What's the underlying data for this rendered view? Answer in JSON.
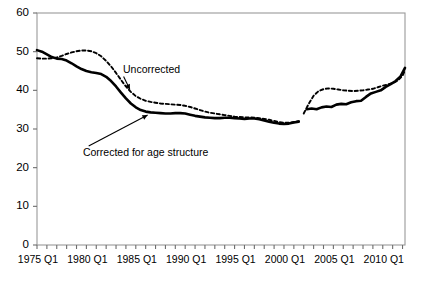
{
  "chart_data": {
    "type": "line",
    "title": "",
    "subtitle": "",
    "xlabel": "",
    "ylabel": "",
    "xlim": [
      1975.0,
      2012.25
    ],
    "ylim": [
      0,
      60
    ],
    "grid": false,
    "legend_position": "inline-annotations",
    "y_ticks": [
      0,
      10,
      20,
      30,
      40,
      50,
      60
    ],
    "y_tick_labels": [
      "0",
      "10",
      "20",
      "30",
      "40",
      "50",
      "60"
    ],
    "x_tick_labels": [
      "1975 Q1",
      "1980 Q1",
      "1985 Q1",
      "1990 Q1",
      "1995 Q1",
      "2000 Q1",
      "2005 Q1",
      "2010 Q1"
    ],
    "x_tick_label_values": [
      1975,
      1980,
      1985,
      1990,
      1995,
      2000,
      2005,
      2010
    ],
    "x_minor_tick_interval": 1,
    "annotations": [
      {
        "text": "Uncorrected",
        "x": 1986.6,
        "y": 44.6,
        "arrow_to_x": 1984.4,
        "arrow_to_y": 40.2
      },
      {
        "text": "Corrected for age structure",
        "x": 1986.0,
        "y": 23.0,
        "arrow_to_x": 1986.2,
        "arrow_to_y": 33.6
      }
    ],
    "series": [
      {
        "name": "Uncorrected",
        "style": "dashed",
        "color": "#000000",
        "segments": [
          {
            "x": [
              1975.0,
              1975.5,
              1976.0,
              1976.5,
              1977.0,
              1977.5,
              1978.0,
              1978.5,
              1979.0,
              1979.5,
              1980.0,
              1980.5,
              1981.0,
              1981.5,
              1982.0,
              1982.5,
              1983.0,
              1983.5,
              1984.0,
              1984.5,
              1985.0,
              1985.5,
              1986.0,
              1986.5,
              1987.0,
              1987.5,
              1988.0,
              1988.5,
              1989.0,
              1989.5,
              1990.0,
              1990.5,
              1991.0,
              1991.5,
              1992.0,
              1992.5,
              1993.0,
              1993.5,
              1994.0,
              1994.5,
              1995.0,
              1995.5,
              1996.0,
              1996.5,
              1997.0,
              1997.5,
              1998.0,
              1998.5,
              1999.0,
              1999.5,
              2000.0,
              2000.5,
              2001.0,
              2001.5
            ],
            "y": [
              48.3,
              48.2,
              48.2,
              48.3,
              48.5,
              48.9,
              49.4,
              49.8,
              50.1,
              50.3,
              50.3,
              50.1,
              49.6,
              48.8,
              47.6,
              46.2,
              44.5,
              42.7,
              41.0,
              39.6,
              38.5,
              37.8,
              37.3,
              37.0,
              36.8,
              36.6,
              36.5,
              36.4,
              36.3,
              36.2,
              36.0,
              35.7,
              35.3,
              34.9,
              34.5,
              34.2,
              34.0,
              33.8,
              33.6,
              33.4,
              33.2,
              33.1,
              33.0,
              33.0,
              32.9,
              32.8,
              32.6,
              32.4,
              32.1,
              31.8,
              31.6,
              31.6,
              31.8,
              32.0
            ]
          },
          {
            "x": [
              2002.0,
              2002.5,
              2003.0,
              2003.5,
              2004.0,
              2004.5,
              2005.0,
              2005.5,
              2006.0,
              2006.5,
              2007.0,
              2007.5,
              2008.0,
              2008.5,
              2009.0,
              2009.5,
              2010.0,
              2010.5,
              2011.0,
              2011.5,
              2012.0,
              2012.25
            ],
            "y": [
              34.0,
              36.5,
              38.6,
              39.8,
              40.3,
              40.5,
              40.4,
              40.2,
              40.0,
              39.9,
              39.8,
              39.9,
              40.0,
              40.2,
              40.4,
              40.8,
              41.2,
              41.5,
              41.9,
              42.5,
              43.8,
              45.2
            ]
          }
        ]
      },
      {
        "name": "Corrected for age structure",
        "style": "solid",
        "color": "#000000",
        "segments": [
          {
            "x": [
              1975.0,
              1975.5,
              1976.0,
              1976.5,
              1977.0,
              1977.5,
              1978.0,
              1978.5,
              1979.0,
              1979.5,
              1980.0,
              1980.5,
              1981.0,
              1981.5,
              1982.0,
              1982.5,
              1983.0,
              1983.5,
              1984.0,
              1984.5,
              1985.0,
              1985.5,
              1986.0,
              1986.5,
              1987.0,
              1987.5,
              1988.0,
              1988.5,
              1989.0,
              1989.5,
              1990.0,
              1990.5,
              1991.0,
              1991.5,
              1992.0,
              1992.5,
              1993.0,
              1993.5,
              1994.0,
              1994.5,
              1995.0,
              1995.5,
              1996.0,
              1996.5,
              1997.0,
              1997.5,
              1998.0,
              1998.5,
              1999.0,
              1999.5,
              2000.0,
              2000.5,
              2001.0,
              2001.5
            ],
            "y": [
              50.4,
              50.0,
              49.3,
              48.6,
              48.2,
              48.1,
              47.7,
              47.0,
              46.2,
              45.5,
              45.0,
              44.7,
              44.5,
              44.2,
              43.5,
              42.4,
              41.0,
              39.4,
              37.9,
              36.6,
              35.6,
              34.9,
              34.5,
              34.3,
              34.2,
              34.1,
              34.0,
              34.0,
              34.1,
              34.1,
              34.0,
              33.7,
              33.4,
              33.2,
              33.0,
              32.9,
              32.8,
              32.8,
              32.9,
              32.9,
              32.8,
              32.7,
              32.6,
              32.7,
              32.7,
              32.5,
              32.2,
              31.9,
              31.6,
              31.4,
              31.3,
              31.4,
              31.7,
              31.9
            ]
          },
          {
            "x": [
              2002.3,
              2002.8,
              2003.3,
              2003.8,
              2004.3,
              2004.8,
              2005.3,
              2005.8,
              2006.3,
              2006.8,
              2007.3,
              2007.8,
              2008.3,
              2008.8,
              2009.3,
              2009.8,
              2010.3,
              2010.8,
              2011.3,
              2011.8,
              2012.25
            ],
            "y": [
              35.1,
              35.3,
              35.1,
              35.6,
              35.8,
              35.7,
              36.3,
              36.5,
              36.4,
              36.9,
              37.2,
              37.3,
              38.3,
              39.2,
              39.6,
              40.0,
              40.9,
              41.6,
              42.4,
              43.6,
              45.8
            ]
          }
        ]
      }
    ]
  }
}
